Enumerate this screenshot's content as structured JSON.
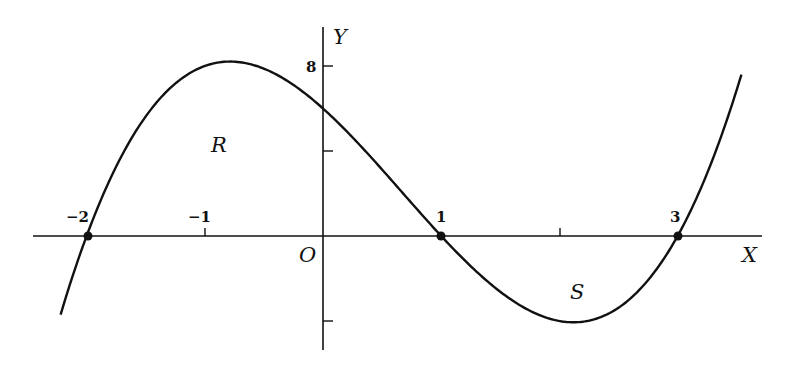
{
  "diagram": {
    "function": "f(x) = (x+2)(x-1)(x-3)",
    "axes": {
      "x_label": "X",
      "y_label": "Y",
      "origin_label": "O"
    },
    "x_ticks": [
      {
        "value": -2,
        "label": "−2"
      },
      {
        "value": -1,
        "label": "−1"
      },
      {
        "value": 1,
        "label": "1"
      },
      {
        "value": 2,
        "label": ""
      },
      {
        "value": 3,
        "label": "3"
      }
    ],
    "y_ticks": [
      {
        "value": 8,
        "label": "8"
      },
      {
        "value": 4,
        "label": ""
      },
      {
        "value": -4,
        "label": ""
      }
    ],
    "roots": [
      -2,
      1,
      3
    ],
    "regions": [
      {
        "label": "R"
      },
      {
        "label": "S"
      }
    ],
    "colors": {
      "ink": "#111111",
      "background": "#ffffff"
    }
  }
}
